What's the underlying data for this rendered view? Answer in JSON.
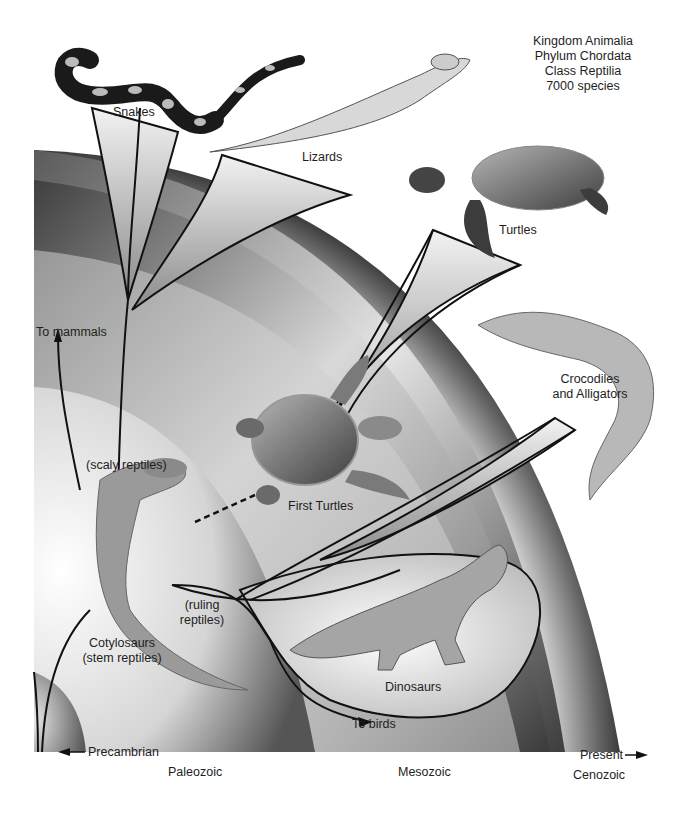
{
  "classification": {
    "kingdom": "Kingdom Animalia",
    "phylum": "Phylum Chordata",
    "class": "Class Reptilia",
    "species_count": "7000 species"
  },
  "groups": {
    "snakes": "Snakes",
    "lizards": "Lizards",
    "turtles": "Turtles",
    "crocodiles_line1": "Crocodiles",
    "crocodiles_line2": "and Alligators",
    "first_turtles": "First Turtles",
    "dinosaurs": "Dinosaurs",
    "cotylosaurs_line1": "Cotylosaurs",
    "cotylosaurs_line2": "(stem reptiles)",
    "scaly_reptiles": "(scaly reptiles)",
    "ruling_line1": "(ruling",
    "ruling_line2": "reptiles)"
  },
  "arrows": {
    "to_mammals": "To mammals",
    "to_birds": "To birds"
  },
  "eras": {
    "precambrian": "Precambrian",
    "paleozoic": "Paleozoic",
    "mesozoic": "Mesozoic",
    "cenozoic": "Cenozoic",
    "present": "Present"
  },
  "colors": {
    "background": "#ffffff",
    "band_dark": "#3a3a3a",
    "band_light": "#efefef",
    "line": "#111111"
  }
}
